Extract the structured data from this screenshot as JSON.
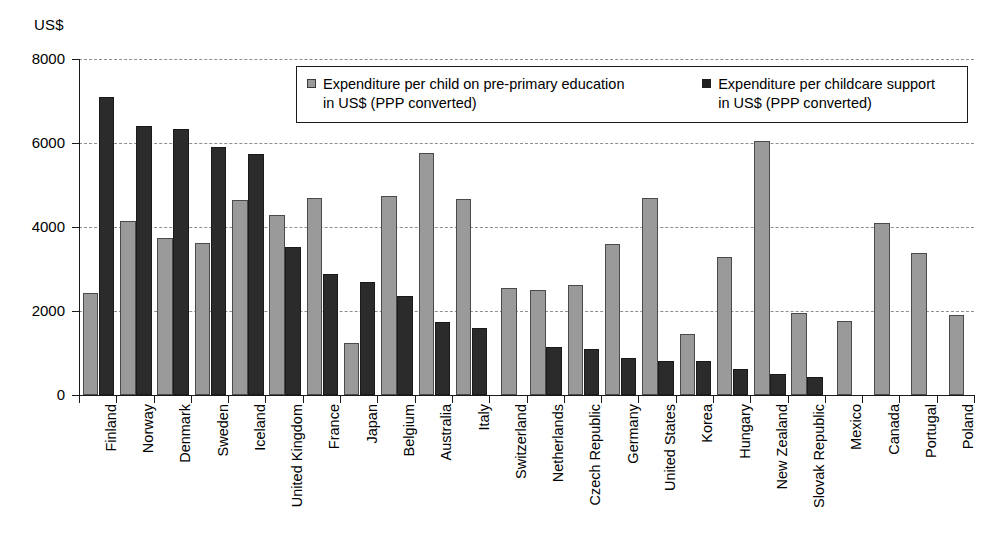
{
  "chart_data": {
    "type": "bar",
    "title": "",
    "subtitle": "",
    "xlabel": "",
    "ylabel": "US$",
    "ylim": [
      0,
      8000
    ],
    "yticks": [
      0,
      2000,
      4000,
      6000,
      8000
    ],
    "ytick_labels": [
      "0",
      "2000",
      "4000",
      "6000",
      "8000"
    ],
    "grid": true,
    "grid_style": "dashed-horizontal",
    "legend_position": "top-center-inside",
    "legend": [
      "Expenditure per child on pre-primary education in US$ (PPP converted)",
      "Expenditure per childcare support in US$ (PPP converted)"
    ],
    "legend_lines": [
      [
        "Expenditure per child on pre-primary education",
        "in US$ (PPP converted)"
      ],
      [
        "Expenditure per childcare support",
        "in US$ (PPP converted)"
      ]
    ],
    "colors": {
      "series_1": "#9a9a9a",
      "series_2": "#2b2b2b",
      "axis": "#1a1a1a",
      "grid": "#8e8e8e",
      "background": "#ffffff"
    },
    "categories": [
      "Finland",
      "Norway",
      "Denmark",
      "Sweden",
      "Iceland",
      "United Kingdom",
      "France",
      "Japan",
      "Belgium",
      "Australia",
      "Italy",
      "Switzerland",
      "Netherlands",
      "Czech Republic",
      "Germany",
      "United States",
      "Korea",
      "Hungary",
      "New Zealand",
      "Slovak Republic",
      "Mexico",
      "Canada",
      "Portugal",
      "Poland"
    ],
    "series": [
      {
        "name": "Expenditure per child on pre-primary education in US$ (PPP converted)",
        "color": "#9a9a9a",
        "values": [
          2440,
          4150,
          3750,
          3620,
          4640,
          4280,
          4690,
          1250,
          4740,
          5760,
          4660,
          2550,
          2490,
          2620,
          3590,
          4700,
          1450,
          3290,
          6050,
          1950,
          1760,
          4100,
          3390,
          1900
        ]
      },
      {
        "name": "Expenditure per childcare support in US$ (PPP converted)",
        "color": "#2b2b2b",
        "values": [
          7100,
          6410,
          6340,
          5910,
          5730,
          3530,
          2870,
          2690,
          2350,
          1750,
          1600,
          null,
          1140,
          1090,
          870,
          820,
          800,
          630,
          500,
          440,
          null,
          null,
          null,
          null
        ]
      }
    ]
  }
}
